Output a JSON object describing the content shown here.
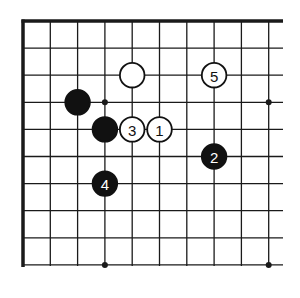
{
  "diagram": {
    "type": "go-board-fragment",
    "grid": {
      "origin_x": 23,
      "origin_y": 21,
      "spacing_x": 27.3,
      "spacing_y": 27.1,
      "columns": 10,
      "rows": 10,
      "right_edge_x": 283,
      "bottom_edge_y": 266,
      "line_color": "#1a1a1a",
      "border_edges": [
        "top",
        "left"
      ]
    },
    "star_points": [
      {
        "col": 3,
        "row": 3
      },
      {
        "col": 9,
        "row": 3
      },
      {
        "col": 3,
        "row": 9
      },
      {
        "col": 9,
        "row": 9
      }
    ],
    "stones": [
      {
        "color": "white",
        "col": 4,
        "row": 2,
        "label": ""
      },
      {
        "color": "white",
        "col": 7,
        "row": 2,
        "label": "5"
      },
      {
        "color": "black",
        "col": 2,
        "row": 3,
        "label": ""
      },
      {
        "color": "black",
        "col": 3,
        "row": 4,
        "label": ""
      },
      {
        "color": "white",
        "col": 4,
        "row": 4,
        "label": "3"
      },
      {
        "color": "white",
        "col": 5,
        "row": 4,
        "label": "1"
      },
      {
        "color": "black",
        "col": 7,
        "row": 5,
        "label": "2"
      },
      {
        "color": "black",
        "col": 3,
        "row": 6,
        "label": "4"
      }
    ],
    "colors": {
      "black_stone": "#111111",
      "white_stone": "#ffffff",
      "stone_outline": "#111111",
      "black_label": "#ffffff",
      "white_label": "#111111"
    }
  }
}
